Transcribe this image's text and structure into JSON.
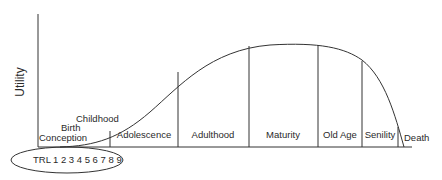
{
  "diagram": {
    "y_axis_label": "Utility",
    "stages": [
      {
        "label": "Conception"
      },
      {
        "label": "Birth"
      },
      {
        "label": "Childhood"
      },
      {
        "label": "Adolescence"
      },
      {
        "label": "Adulthood"
      },
      {
        "label": "Maturity"
      },
      {
        "label": "Old Age"
      },
      {
        "label": "Senility"
      },
      {
        "label": "Death"
      }
    ],
    "trl": {
      "prefix": "TRL",
      "levels": "1 2 3 4 5 6 7 8 9"
    }
  },
  "colors": {
    "line": "#333333",
    "text": "#2a2a2a",
    "background": "#ffffff"
  }
}
